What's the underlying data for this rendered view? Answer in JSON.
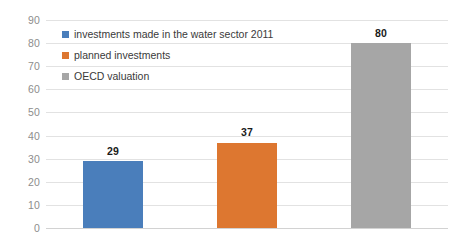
{
  "chart_data": {
    "type": "bar",
    "title": "",
    "subtitle": "",
    "xlabel": "",
    "ylabel": "",
    "categories": [
      "investments made in the water sector 2011",
      "planned investments",
      "OECD valuation"
    ],
    "values": [
      29,
      37,
      80
    ],
    "data_labels": [
      "29",
      "37",
      "80"
    ],
    "colors": [
      "#4a7ebb",
      "#dd7730",
      "#a6a6a6"
    ],
    "ylim": [
      0,
      90
    ],
    "ytick_step": 10,
    "ytick_labels": [
      "90",
      "80",
      "70",
      "60",
      "50",
      "40",
      "30",
      "20",
      "10",
      "0"
    ],
    "ytick_values": [
      90,
      80,
      70,
      60,
      50,
      40,
      30,
      20,
      10,
      0
    ],
    "grid": true,
    "grid_axis": "y",
    "xtick_labels": [],
    "legend": {
      "position": "upper-left-inside",
      "entries": [
        {
          "label": "investments made in the water sector 2011",
          "color": "#4a7ebb"
        },
        {
          "label": "planned investments",
          "color": "#dd7730"
        },
        {
          "label": "OECD valuation",
          "color": "#a6a6a6"
        }
      ]
    },
    "gridline_color": "#e2e2e2",
    "axis_text_color": "#8d8d8d",
    "background": "#ffffff"
  }
}
